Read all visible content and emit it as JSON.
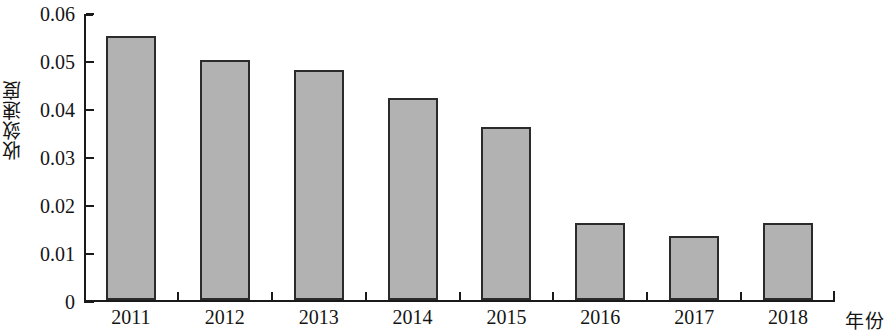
{
  "chart_data": {
    "type": "bar",
    "title": "",
    "subtitle": "",
    "xlabel": "年份",
    "ylabel": "收敛速度",
    "categories": [
      "2011",
      "2012",
      "2013",
      "2014",
      "2015",
      "2016",
      "2017",
      "2018"
    ],
    "values": [
      0.055,
      0.05,
      0.048,
      0.042,
      0.036,
      0.016,
      0.0133,
      0.016
    ],
    "series": [
      {
        "name": "收敛速度",
        "values": [
          0.055,
          0.05,
          0.048,
          0.042,
          0.036,
          0.016,
          0.0133,
          0.016
        ]
      }
    ],
    "ylim": [
      0,
      0.06
    ],
    "yticks": [
      0,
      0.01,
      0.02,
      0.03,
      0.04,
      0.05,
      0.06
    ],
    "ytick_labels": [
      "0",
      "0.01",
      "0.02",
      "0.03",
      "0.04",
      "0.05",
      "0.06"
    ],
    "grid": false,
    "legend": false,
    "legend_position": "none",
    "bar_fill_color": "#b2b2b2",
    "bar_edge_color": "#2b2b2b",
    "axis_color": "#1a1a1a",
    "background_color": "#ffffff"
  }
}
